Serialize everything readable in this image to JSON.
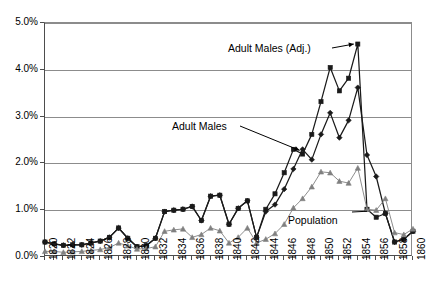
{
  "chart_data": {
    "type": "line",
    "title": "",
    "xlabel": "",
    "ylabel": "",
    "xlim": [
      1820,
      1860
    ],
    "ylim": [
      0.0,
      5.0
    ],
    "y_tick_labels": [
      "0.0%",
      "1.0%",
      "2.0%",
      "3.0%",
      "4.0%",
      "5.0%"
    ],
    "y_tick_values": [
      0.0,
      1.0,
      2.0,
      3.0,
      4.0,
      5.0
    ],
    "y_unit": "%",
    "grid": "horizontal",
    "legend": "none (series labeled by in-plot annotations)",
    "x_tick_labels": [
      "1820",
      "1822",
      "1824",
      "1826",
      "1828",
      "1830",
      "1832",
      "1834",
      "1836",
      "1838",
      "1840",
      "1842",
      "1844",
      "1846",
      "1848",
      "1850",
      "1852",
      "1854",
      "1856",
      "1858",
      "1860"
    ],
    "x_tick_values": [
      1820,
      1822,
      1824,
      1826,
      1828,
      1830,
      1832,
      1834,
      1836,
      1838,
      1840,
      1842,
      1844,
      1846,
      1848,
      1850,
      1852,
      1854,
      1856,
      1858,
      1860
    ],
    "x": [
      1820,
      1821,
      1822,
      1823,
      1824,
      1825,
      1826,
      1827,
      1828,
      1829,
      1830,
      1831,
      1832,
      1833,
      1834,
      1835,
      1836,
      1837,
      1838,
      1839,
      1840,
      1841,
      1842,
      1843,
      1844,
      1845,
      1846,
      1847,
      1848,
      1849,
      1850,
      1851,
      1852,
      1853,
      1854,
      1855,
      1856,
      1857,
      1858,
      1859,
      1860
    ],
    "series": [
      {
        "name": "Adult Males (Adj.)",
        "color": "#1a1a1a",
        "marker": "square",
        "values": [
          0.32,
          0.28,
          0.25,
          0.26,
          0.26,
          0.3,
          0.34,
          0.42,
          0.62,
          0.4,
          0.22,
          0.24,
          0.4,
          0.97,
          1.0,
          1.02,
          1.08,
          0.78,
          1.3,
          1.32,
          0.7,
          1.04,
          1.2,
          0.42,
          1.02,
          1.35,
          1.8,
          2.3,
          2.2,
          2.62,
          3.32,
          4.05,
          3.55,
          3.82,
          4.55,
          1.02,
          0.85,
          0.93,
          0.32,
          0.38,
          0.55
        ]
      },
      {
        "name": "Adult Males",
        "color": "#1a1a1a",
        "marker": "diamond",
        "values": [
          0.32,
          0.28,
          0.25,
          0.26,
          0.26,
          0.3,
          0.34,
          0.42,
          0.62,
          0.4,
          0.22,
          0.24,
          0.4,
          0.97,
          1.0,
          1.02,
          1.08,
          0.78,
          1.3,
          1.32,
          0.7,
          1.04,
          1.2,
          0.42,
          0.97,
          1.12,
          1.45,
          1.88,
          2.3,
          2.08,
          2.62,
          3.08,
          2.55,
          2.92,
          3.62,
          2.18,
          1.72,
          0.93,
          0.32,
          0.38,
          0.55
        ]
      },
      {
        "name": "Population",
        "color": "#808080",
        "marker": "triangle",
        "values": [
          0.12,
          0.12,
          0.1,
          0.11,
          0.12,
          0.14,
          0.16,
          0.2,
          0.3,
          0.24,
          0.17,
          0.18,
          0.22,
          0.55,
          0.58,
          0.6,
          0.42,
          0.48,
          0.62,
          0.56,
          0.3,
          0.42,
          0.62,
          0.3,
          0.38,
          0.5,
          0.7,
          1.05,
          1.25,
          1.5,
          1.82,
          1.8,
          1.62,
          1.58,
          1.9,
          1.02,
          1.0,
          1.25,
          0.52,
          0.48,
          0.6
        ]
      }
    ],
    "annotations": [
      {
        "text": "Adult Males (Adj.)",
        "points_to_series": "Adult Males (Adj.)",
        "points_to_x": 1854
      },
      {
        "text": "Adult Males",
        "points_to_series": "Adult Males",
        "points_to_x": 1848
      },
      {
        "text": "Population",
        "points_to_series": "Population",
        "points_to_x": 1855
      }
    ]
  }
}
